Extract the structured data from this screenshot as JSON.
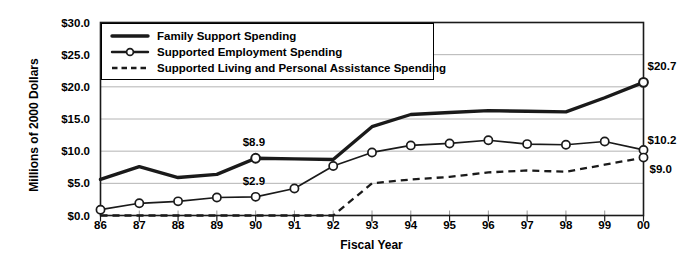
{
  "chart_data": {
    "type": "line",
    "title": "",
    "xlabel": "Fiscal Year",
    "ylabel": "Millions of 2000 Dollars",
    "categories": [
      "86",
      "87",
      "88",
      "89",
      "90",
      "91",
      "92",
      "93",
      "94",
      "95",
      "96",
      "97",
      "98",
      "99",
      "00"
    ],
    "ylim": [
      0,
      30
    ],
    "yticks": [
      0,
      5,
      10,
      15,
      20,
      25,
      30
    ],
    "ytick_labels": [
      "$0.0",
      "$5.0",
      "$10.0",
      "$15.0",
      "$20.0",
      "$25.0",
      "$30.0"
    ],
    "grid": "horizontal",
    "legend_position": "top-left-inside",
    "series": [
      {
        "name": "Family Support Spending",
        "style": "solid-thick",
        "markers": false,
        "values": [
          5.6,
          7.6,
          5.9,
          6.4,
          8.9,
          8.8,
          8.7,
          13.8,
          15.7,
          16.0,
          16.3,
          16.2,
          16.1,
          18.3,
          20.7
        ]
      },
      {
        "name": "Supported Employment Spending",
        "style": "solid-marker",
        "markers": true,
        "values": [
          0.9,
          1.9,
          2.2,
          2.8,
          2.9,
          4.2,
          7.7,
          9.8,
          10.9,
          11.2,
          11.7,
          11.1,
          11.0,
          11.5,
          10.2
        ]
      },
      {
        "name": "Supported Living and Personal Assistance Spending",
        "style": "dashed",
        "markers": false,
        "values": [
          0.0,
          0.0,
          0.0,
          0.0,
          0.0,
          0.0,
          0.0,
          5.0,
          5.6,
          6.0,
          6.7,
          7.0,
          6.8,
          7.9,
          9.0
        ]
      }
    ],
    "annotations": [
      {
        "label": "$8.9",
        "series": "Family Support Spending",
        "x": "90",
        "value": 8.9
      },
      {
        "label": "$2.9",
        "series": "Supported Employment Spending",
        "x": "90",
        "value": 2.9
      },
      {
        "label": "$20.7",
        "series": "Family Support Spending",
        "x": "00",
        "value": 20.7
      },
      {
        "label": "$10.2",
        "series": "Supported Employment Spending",
        "x": "00",
        "value": 10.2
      },
      {
        "label": "$9.0",
        "series": "Supported Living and Personal Assistance Spending",
        "x": "00",
        "value": 9.0
      }
    ],
    "colors": {
      "line": "#1a1a1a",
      "grid": "#b4b4b4",
      "frame": "#1a1a1a",
      "marker_fill": "#ffffff",
      "background": "#ffffff"
    }
  },
  "legend": {
    "items": [
      {
        "label": "Family Support Spending",
        "sample": "solid-thick-line-swatch"
      },
      {
        "label": "Supported Employment Spending",
        "sample": "solid-line-circle-marker-swatch"
      },
      {
        "label": "Supported Living and Personal Assistance Spending",
        "sample": "dashed-line-swatch"
      }
    ]
  },
  "axes": {
    "y_title": "Millions of 2000 Dollars",
    "x_title": "Fiscal Year"
  }
}
